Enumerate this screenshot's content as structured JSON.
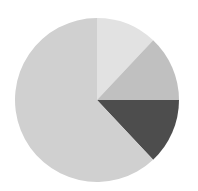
{
  "chart_data": {
    "type": "pie",
    "title": "",
    "start_angle_deg": 0,
    "direction": "clockwise",
    "labels": [
      "Slice 1",
      "Slice 2",
      "Slice 3",
      "Slice 4"
    ],
    "values": [
      12,
      13,
      13,
      62
    ],
    "colors": [
      "#e2e2e2",
      "#c0c0c0",
      "#4d4d4d",
      "#d0d0d0"
    ],
    "legend": "none",
    "data_labels": "none"
  },
  "geometry": {
    "cx": 97,
    "cy": 100,
    "r": 82
  }
}
